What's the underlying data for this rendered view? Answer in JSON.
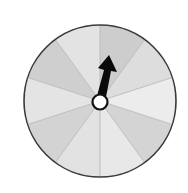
{
  "spinner": {
    "sector_count": 10,
    "sector_fills": [
      "#e3e3e3",
      "#cfcfcf",
      "#e4e4e4",
      "#d3d3d3",
      "#e2e2e2",
      "#e8e8e8",
      "#d4d4d4",
      "#ececec",
      "#dddddd",
      "#cdcdcd"
    ],
    "rim_color": "#3a3a3a",
    "divider_color": "#b5b5b5",
    "hub_fill": "#ffffff",
    "hub_stroke": "#111111",
    "arrow_color": "#0a0a0a",
    "arrow_direction": "up-right"
  }
}
